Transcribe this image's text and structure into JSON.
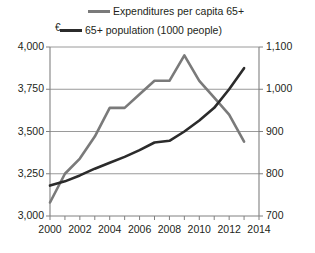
{
  "chart_data": {
    "type": "line",
    "title": "",
    "xlabel": "",
    "ylabel": "€",
    "x": [
      2000,
      2001,
      2002,
      2003,
      2004,
      2005,
      2006,
      2007,
      2008,
      2009,
      2010,
      2011,
      2012,
      2013
    ],
    "xlim": [
      2000,
      2014
    ],
    "xticks": [
      2000,
      2001,
      2002,
      2003,
      2004,
      2005,
      2006,
      2007,
      2008,
      2009,
      2010,
      2011,
      2012,
      2013,
      2014
    ],
    "xtick_labels": [
      "2000",
      "",
      "2002",
      "",
      "2004",
      "",
      "2006",
      "",
      "2008",
      "",
      "2010",
      "",
      "2012",
      "",
      "2014"
    ],
    "xtick_labels_shown": [
      "2000",
      "2002",
      "2004",
      "2006",
      "2008",
      "2010",
      "2012",
      "2014"
    ],
    "grid": true,
    "legend_position": "top",
    "series": [
      {
        "name": "Expenditures per capita 65+",
        "axis": "left",
        "color": "#7a7a7a",
        "unit": "€",
        "values": [
          3080,
          3250,
          3340,
          3470,
          3640,
          3640,
          3720,
          3800,
          3800,
          3950,
          3800,
          3700,
          3600,
          3440
        ]
      },
      {
        "name": "65+ population (1000 people)",
        "axis": "right",
        "color": "#2b2b2b",
        "unit": "1000 people",
        "values": [
          772,
          782,
          796,
          812,
          826,
          840,
          856,
          874,
          878,
          900,
          926,
          956,
          1000,
          1050
        ]
      }
    ],
    "y_left": {
      "label": "€",
      "lim": [
        3000,
        4000
      ],
      "ticks": [
        3000,
        3250,
        3500,
        3750,
        4000
      ],
      "tick_labels": [
        "3,000",
        "3,250",
        "3,500",
        "3,750",
        "4,000"
      ]
    },
    "y_right": {
      "label": "",
      "lim": [
        700,
        1100
      ],
      "ticks": [
        700,
        800,
        900,
        1000,
        1100
      ],
      "tick_labels": [
        "700",
        "800",
        "900",
        "1,000",
        "1,100"
      ]
    },
    "legend": [
      {
        "label": "Expenditures per capita 65+",
        "color": "#7a7a7a"
      },
      {
        "label": "65+ population (1000 people)",
        "color": "#2b2b2b"
      }
    ]
  }
}
